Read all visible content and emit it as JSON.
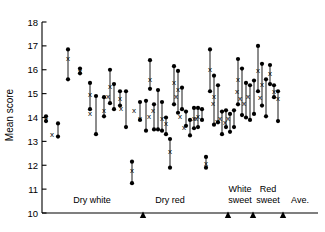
{
  "chart_data": {
    "type": "scatter",
    "title": "",
    "xlabel": "",
    "ylabel": "Mean score",
    "ylim": [
      10,
      18
    ],
    "yticks": [
      10,
      11,
      12,
      13,
      14,
      15,
      16,
      17,
      18
    ],
    "ytick_labels": [
      "10",
      "11",
      "12",
      "13",
      "14",
      "15",
      "16",
      "17",
      "18"
    ],
    "grid": false,
    "legend": "none",
    "marker_note": "each item: vertical line from low to high with filled circles at both ends; an x marker gives the middle value",
    "group_labels": [
      "Dry white",
      "Dry red",
      "White sweet",
      "Red sweet",
      "Ave."
    ],
    "group_boundaries_x": [
      143,
      228,
      253,
      283
    ],
    "series": [
      {
        "name": "high",
        "values": [
          14.05,
          13.75,
          16.85,
          16.05,
          15.45,
          14.9,
          14.85,
          16.0,
          15.4,
          15.1,
          15.1,
          12.15,
          14.65,
          14.7,
          16.4,
          14.55,
          15.15,
          14.65,
          14.0,
          13.1,
          16.15,
          15.95,
          15.25,
          14.25,
          13.9,
          14.4,
          14.4,
          14.35,
          12.35,
          16.85,
          15.75,
          15.35,
          14.25,
          14.3,
          14.15,
          14.3,
          16.45,
          16.05,
          15.45,
          15.35,
          15.55,
          17.0,
          16.25,
          15.6,
          16.2,
          15.35,
          15.1
        ]
      },
      {
        "name": "mid",
        "values": [
          13.95,
          13.3,
          16.5,
          15.95,
          15.0,
          14.2,
          14.3,
          15.3,
          14.9,
          14.8,
          14.4,
          11.8,
          14.3,
          14.0,
          15.6,
          14.05,
          14.3,
          14.0,
          13.75,
          12.6,
          15.5,
          15.2,
          14.9,
          14.05,
          13.6,
          14.0,
          14.05,
          14.0,
          12.1,
          16.05,
          14.9,
          14.6,
          13.85,
          14.0,
          13.8,
          14.0,
          15.6,
          15.1,
          14.8,
          14.6,
          14.9,
          16.0,
          15.4,
          14.85,
          15.85,
          15.1,
          14.8
        ]
      },
      {
        "name": "low",
        "values": [
          13.85,
          13.2,
          15.6,
          15.85,
          14.35,
          13.3,
          14.05,
          14.6,
          14.35,
          14.5,
          13.6,
          11.25,
          13.9,
          13.45,
          15.2,
          13.5,
          13.5,
          13.45,
          13.3,
          11.9,
          14.55,
          14.2,
          14.35,
          13.65,
          13.25,
          13.55,
          13.6,
          13.9,
          11.9,
          15.1,
          13.7,
          13.8,
          13.3,
          13.6,
          13.4,
          13.6,
          14.55,
          14.1,
          14.0,
          13.9,
          14.15,
          15.1,
          14.5,
          14.05,
          15.4,
          14.85,
          13.85
        ]
      },
      {
        "name": "x_offset_px",
        "values": [
          0,
          -6,
          0,
          0,
          0,
          -6,
          0,
          0,
          -6,
          0,
          -5,
          0,
          -6,
          -6,
          0,
          -5,
          -5,
          0,
          0,
          0,
          0,
          0,
          -6,
          -6,
          -6,
          0,
          0,
          -6,
          0,
          0,
          0,
          -5,
          -5,
          -6,
          -5,
          -6,
          0,
          -5,
          -6,
          -6,
          -6,
          0,
          0,
          -6,
          0,
          0,
          0
        ]
      },
      {
        "name": "x_px",
        "values": [
          46,
          58,
          68,
          80,
          90,
          96,
          104,
          110,
          114,
          120,
          126,
          132,
          140,
          146,
          150,
          154,
          158,
          162,
          166,
          170,
          174,
          178,
          182,
          186,
          190,
          194,
          198,
          202,
          206,
          210,
          214,
          218,
          222,
          226,
          230,
          234,
          238,
          242,
          246,
          250,
          254,
          258,
          262,
          266,
          270,
          274,
          278
        ]
      }
    ]
  },
  "points": [
    {
      "x": 46,
      "high": 14.05,
      "mid": 13.95,
      "low": 13.85,
      "xdx": 0
    },
    {
      "x": 48,
      "high": 13.95,
      "mid": 13.9,
      "low": 13.8,
      "xdx": 0
    },
    {
      "x": 58,
      "high": 13.75,
      "mid": 13.35,
      "low": 13.3,
      "xdx": -7
    },
    {
      "x": 66,
      "high": 16.85,
      "mid": 17.2,
      "low": 15.6,
      "xdx": 0
    },
    {
      "x": 52,
      "high": 12.15,
      "mid": 11.7,
      "low": 11.25,
      "xdx": 0
    },
    {
      "x": 76,
      "high": 15.45,
      "mid": 16.05,
      "low": 14.35,
      "xdx": 0
    },
    {
      "x": 70,
      "high": 14.9,
      "mid": 14.55,
      "low": 14.5,
      "xdx": -7
    },
    {
      "x": 86,
      "high": 14.85,
      "mid": 14.4,
      "low": 13.45,
      "xdx": -1
    },
    {
      "x": 92,
      "high": 15.1,
      "mid": 14.8,
      "low": 13.6,
      "xdx": 0
    }
  ],
  "y_axis": {
    "label": "Mean score",
    "ticks": [
      "18",
      "17",
      "16",
      "15",
      "14",
      "13",
      "12",
      "11",
      "10"
    ]
  },
  "x_axis": {
    "groups": [
      {
        "id": "dry-white",
        "label": "Dry white"
      },
      {
        "id": "dry-red",
        "label": "Dry red"
      },
      {
        "id": "white-sweet",
        "label_line1": "White",
        "label_line2": "sweet"
      },
      {
        "id": "red-sweet",
        "label_line1": "Red",
        "label_line2": "sweet"
      },
      {
        "id": "average",
        "label": "Ave."
      }
    ]
  },
  "colors": {
    "ink": "#000000",
    "background": "#ffffff"
  }
}
